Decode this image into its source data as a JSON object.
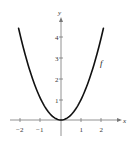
{
  "chart_data": {
    "type": "line",
    "title": "",
    "xlabel": "x",
    "ylabel": "y",
    "xlim": [
      -2.2,
      2.4
    ],
    "ylim": [
      -0.5,
      4.9
    ],
    "grid": false,
    "legend": null,
    "x_ticks": [
      -2,
      -1,
      1,
      2
    ],
    "x_tick_labels": [
      "−2",
      "−1",
      "1",
      "2"
    ],
    "y_ticks": [
      1,
      2,
      3,
      4
    ],
    "y_tick_labels": [
      "1",
      "2",
      "3",
      "4"
    ],
    "series": [
      {
        "name": "f",
        "function": "f(x) = x^2",
        "x": [
          -2.1,
          -2,
          -1.5,
          -1,
          -0.5,
          0,
          0.5,
          1,
          1.5,
          2,
          2.1
        ],
        "values": [
          4.41,
          4,
          2.25,
          1,
          0.25,
          0,
          0.25,
          1,
          2.25,
          4,
          4.41
        ],
        "color": "#111111"
      }
    ],
    "annotations": [
      {
        "text": "f",
        "x": 1.95,
        "y": 2.8
      }
    ]
  },
  "labels": {
    "x_axis": "x",
    "y_axis": "y",
    "curve": "f",
    "xt0": "−2",
    "xt1": "−1",
    "xt2": "1",
    "xt3": "2",
    "yt0": "1",
    "yt1": "2",
    "yt2": "3",
    "yt3": "4"
  }
}
